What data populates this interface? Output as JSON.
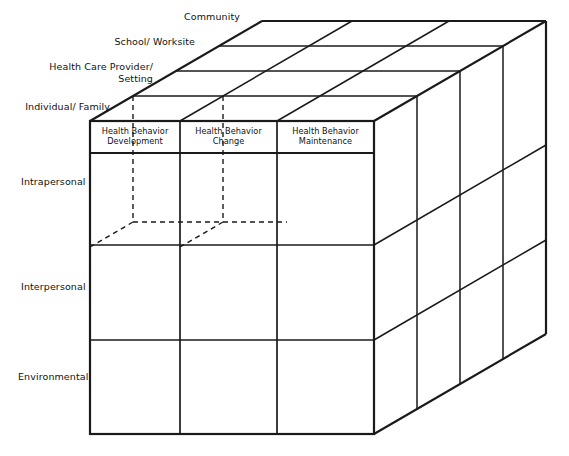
{
  "figure": {
    "type": "3d-cube-matrix-diagram",
    "title_visible": false,
    "colors": {
      "line": "#1a1a1a",
      "background": "#ffffff",
      "text": "#111111"
    }
  },
  "axes": {
    "depth_axis": {
      "name": "Setting / Level of Intervention",
      "labels": [
        "Individual/ Family",
        "Health Care Provider/\nSetting",
        "School/ Worksite",
        "Community"
      ]
    },
    "vertical_axis": {
      "name": "Level of Influence",
      "labels": [
        "Intrapersonal",
        "Interpersonal",
        "Environmental"
      ]
    },
    "horizontal_axis": {
      "name": "Health Behavior Phase",
      "labels": [
        "Health Behavior\nDevelopment",
        "Health Behavior\nChange",
        "Health Behavior\nMaintenance"
      ]
    }
  },
  "front_face": {
    "column_headers": [
      "Health Behavior\nDevelopment",
      "Health Behavior\nChange",
      "Health Behavior\nMaintenance"
    ],
    "row_labels": [
      "Intrapersonal",
      "Interpersonal",
      "Environmental"
    ],
    "cells": [
      [
        "",
        "",
        ""
      ],
      [
        "",
        "",
        ""
      ],
      [
        "",
        "",
        ""
      ]
    ]
  },
  "depth_labels": [
    "Individual/ Family",
    "Health Care Provider/\nSetting",
    "School/ Worksite",
    "Community"
  ],
  "hidden_cell_outline": {
    "described": "dashed lines indicating a hidden interior cell one slice behind the front face, spanning the first two columns of the top (Intrapersonal) row",
    "style": "dashed"
  }
}
